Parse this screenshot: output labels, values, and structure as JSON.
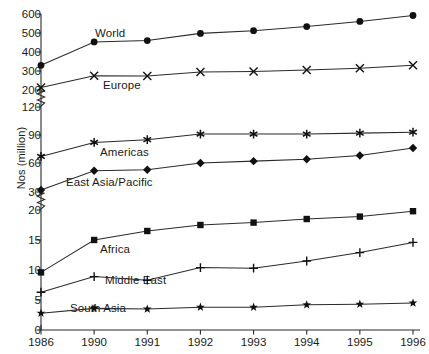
{
  "chart_data": {
    "type": "line",
    "title": "",
    "subtitle": "",
    "xlabel": "",
    "ylabel": "Nos (million)",
    "categories": [
      "1986",
      "1990",
      "1991",
      "1992",
      "1993",
      "1994",
      "1995",
      "1996"
    ],
    "grid": false,
    "legend_position": "inline-labels",
    "axis_note": "y-axis has two breaks (zigzag marks) between 200 and 120, and between 30 and 20",
    "yticks": [
      0,
      5,
      10,
      15,
      20,
      30,
      60,
      90,
      120,
      200,
      300,
      400,
      500,
      600
    ],
    "ytick_labels": [
      "0",
      "5",
      "10",
      "15",
      "20",
      "30",
      "60",
      "90",
      "120",
      "200",
      "300",
      "400",
      "500",
      "600"
    ],
    "ylim": [
      0,
      600
    ],
    "series": [
      {
        "name": "World",
        "marker": "filled-circle",
        "values": [
          330,
          453,
          460,
          498,
          512,
          534,
          561,
          592
        ]
      },
      {
        "name": "Europe",
        "marker": "x-cross",
        "values": [
          213,
          275,
          274,
          295,
          297,
          305,
          315,
          330
        ]
      },
      {
        "name": "Americas",
        "marker": "asterisk",
        "values": [
          67,
          82,
          85,
          91,
          91,
          91,
          92,
          93
        ]
      },
      {
        "name": "East Asia/Pacific",
        "marker": "filled-diamond",
        "values": [
          32,
          52,
          53,
          60,
          62,
          64,
          68,
          76
        ]
      },
      {
        "name": "Africa",
        "marker": "filled-square",
        "values": [
          9.6,
          15.0,
          16.5,
          17.5,
          17.9,
          18.5,
          18.9,
          19.8
        ]
      },
      {
        "name": "Middle East",
        "marker": "plus",
        "values": [
          6.3,
          8.9,
          8.3,
          10.4,
          10.3,
          11.5,
          12.9,
          14.6
        ]
      },
      {
        "name": "South Asia",
        "marker": "filled-star",
        "values": [
          2.8,
          3.6,
          3.5,
          3.8,
          3.8,
          4.2,
          4.3,
          4.5
        ]
      }
    ]
  },
  "yaxis": {
    "title": "Nos (million)"
  },
  "series_labels": [
    {
      "text": "World",
      "x": 95,
      "y": 27
    },
    {
      "text": "Europe",
      "x": 103,
      "y": 79
    },
    {
      "text": "Americas",
      "x": 100,
      "y": 146
    },
    {
      "text": "East Asia/Pacific",
      "x": 66,
      "y": 176
    },
    {
      "text": "Africa",
      "x": 100,
      "y": 243
    },
    {
      "text": "Middle East",
      "x": 105,
      "y": 274
    },
    {
      "text": "South Asia",
      "x": 70,
      "y": 302
    }
  ]
}
